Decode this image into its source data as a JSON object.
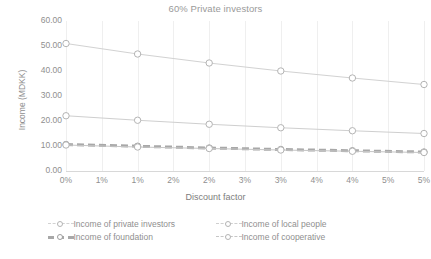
{
  "chart_data": {
    "type": "line",
    "title": "60% Private investors",
    "xlabel": "Discount factor",
    "ylabel": "Income (MDKK)",
    "grid": "vertical",
    "legend_position": "bottom",
    "ylim": [
      0,
      60
    ],
    "yticks": [
      "0.00",
      "10.00",
      "20.00",
      "30.00",
      "40.00",
      "50.00",
      "60.00"
    ],
    "xtick_labels": [
      "0%",
      "1%",
      "1%",
      "2%",
      "2%",
      "3%",
      "3%",
      "4%",
      "4%",
      "5%",
      "5%"
    ],
    "x": [
      0,
      1,
      2,
      3,
      4,
      5
    ],
    "series": [
      {
        "name": "Income of private investors",
        "color": "#d2d2d2",
        "marker": "circle",
        "values": [
          51.0,
          46.8,
          43.2,
          40.0,
          37.2,
          34.6
        ]
      },
      {
        "name": "Income of local people",
        "color": "#cfcfcf",
        "marker": "circle",
        "values": [
          22.1,
          20.3,
          18.7,
          17.3,
          16.1,
          15.0
        ]
      },
      {
        "name": "Income of foundation",
        "color": "#a8a8a8",
        "marker": "dashed",
        "values": [
          10.6,
          9.9,
          9.2,
          8.6,
          8.1,
          7.6
        ]
      },
      {
        "name": "Income of cooperative",
        "color": "#c6c6c6",
        "marker": "circle",
        "values": [
          10.4,
          9.6,
          9.0,
          8.4,
          7.9,
          7.4
        ]
      }
    ]
  },
  "caption": ""
}
